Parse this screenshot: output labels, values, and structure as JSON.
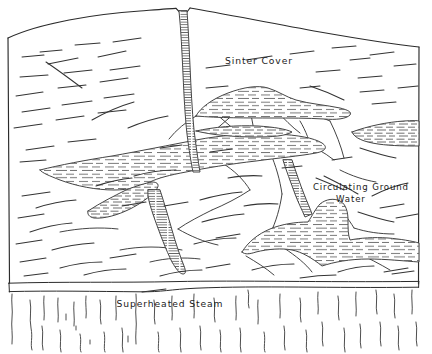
{
  "figure": {
    "kind": "hand-drawn geological cross-section diagram",
    "background_color": "#ffffff",
    "ink_color": "#2b2b2b",
    "width": 432,
    "height": 354
  },
  "labels": {
    "sinter_cover": "Sinter Cover",
    "circulating_ground_line1": "Circulating Ground",
    "circulating_ground_line2": "Water",
    "superheated_steam": "Superheated Steam"
  },
  "regions": {
    "rock_mass": {
      "name": "sinter-cover-rock-body",
      "fill": "#ffffff",
      "outline": "#2b2b2b",
      "description": "Large domed rock mass with short striation hatch marks"
    },
    "water_bodies": {
      "name": "circulating-ground-water",
      "fill": "#ffffff",
      "hatch": "#555555",
      "hatch_style": "short horizontal dashes",
      "count": 6
    },
    "conduit": {
      "name": "vertical-water-conduit",
      "description": "Narrow vertical channel from surface notch down into the rock body"
    },
    "steam_zone": {
      "name": "superheated-steam-zone",
      "description": "Band beneath the double baseline filled with wavy vertical steam strokes",
      "steam_stroke_count": 26
    }
  },
  "geometry": {
    "frame_top_apex_x": 182,
    "frame_top_apex_y": 8,
    "frame_left_x": 8,
    "frame_right_x": 419,
    "baseline_upper_y": 284,
    "baseline_lower_y": 292,
    "bottom_y": 353
  }
}
